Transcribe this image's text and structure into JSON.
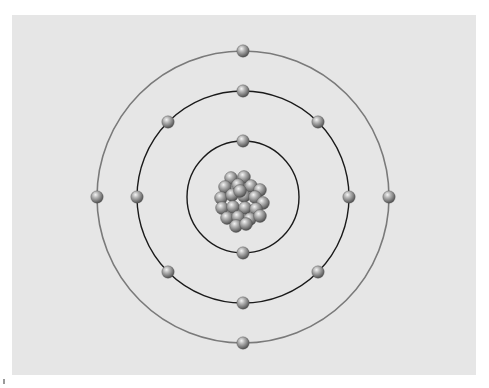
{
  "diagram": {
    "background_color": "#e6e6e6",
    "nucleus": {
      "label": "nucleus",
      "particle_count": 22,
      "particle_color": "#8c8c8c"
    },
    "shells": [
      {
        "name": "inner-shell",
        "electron_count": 2,
        "stroke": "#1a1a1a"
      },
      {
        "name": "middle-shell",
        "electron_count": 8,
        "stroke": "#1a1a1a"
      },
      {
        "name": "outer-shell",
        "electron_count": 4,
        "stroke": "#7a7a7a"
      }
    ],
    "electron_color": "#8a8a8a",
    "total_electrons": 14
  }
}
